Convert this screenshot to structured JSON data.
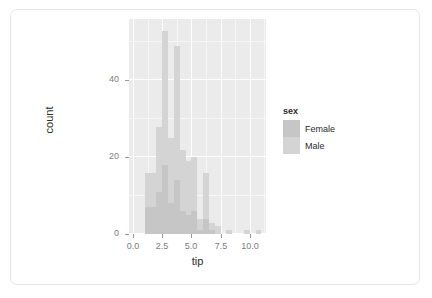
{
  "chart_data": {
    "type": "bar",
    "title": "",
    "subtitle": "",
    "xlabel": "tip",
    "ylabel": "count",
    "xlim": [
      -0.35,
      11.4
    ],
    "ylim": [
      0,
      56
    ],
    "xticks": [
      "0.0",
      "2.5",
      "5.0",
      "7.5",
      "10.0"
    ],
    "xtick_values": [
      0.0,
      2.5,
      5.0,
      7.5,
      10.0
    ],
    "yticks": [
      "0",
      "20",
      "40"
    ],
    "ytick_values": [
      0,
      20,
      40
    ],
    "grid": true,
    "legend_position": "right",
    "legend_title": "sex",
    "bin_width": 0.5,
    "stacked": true,
    "series": [
      {
        "name": "Female",
        "color": "#c6c6c6"
      },
      {
        "name": "Male",
        "color": "#d4d4d4"
      }
    ],
    "bins": [
      {
        "x0": 1.0,
        "x1": 1.5,
        "female": 7,
        "male": 9,
        "total": 16
      },
      {
        "x0": 1.5,
        "x1": 2.0,
        "female": 7,
        "male": 9,
        "total": 16
      },
      {
        "x0": 2.0,
        "x1": 2.5,
        "female": 11,
        "male": 17,
        "total": 28
      },
      {
        "x0": 2.5,
        "x1": 3.0,
        "female": 18,
        "male": 35,
        "total": 53
      },
      {
        "x0": 3.0,
        "x1": 3.5,
        "female": 8,
        "male": 17,
        "total": 25
      },
      {
        "x0": 3.5,
        "x1": 4.0,
        "female": 14,
        "male": 35,
        "total": 49
      },
      {
        "x0": 4.0,
        "x1": 4.5,
        "female": 6,
        "male": 16,
        "total": 22
      },
      {
        "x0": 4.5,
        "x1": 5.0,
        "female": 5,
        "male": 14,
        "total": 19
      },
      {
        "x0": 5.0,
        "x1": 5.5,
        "female": 6,
        "male": 14,
        "total": 20
      },
      {
        "x0": 5.5,
        "x1": 6.0,
        "female": 1,
        "male": 3,
        "total": 4
      },
      {
        "x0": 6.0,
        "x1": 6.5,
        "female": 4,
        "male": 12,
        "total": 16
      },
      {
        "x0": 6.5,
        "x1": 7.0,
        "female": 1,
        "male": 2,
        "total": 3
      },
      {
        "x0": 7.0,
        "x1": 7.5,
        "female": 0,
        "male": 2,
        "total": 2
      },
      {
        "x0": 8.0,
        "x1": 8.5,
        "female": 0,
        "male": 1,
        "total": 1
      },
      {
        "x0": 9.5,
        "x1": 10.0,
        "female": 0,
        "male": 1,
        "total": 1
      },
      {
        "x0": 10.5,
        "x1": 11.0,
        "female": 0,
        "male": 1,
        "total": 1
      }
    ]
  },
  "legend": {
    "title": "sex",
    "items": [
      {
        "label": "Female",
        "color": "#c6c6c6"
      },
      {
        "label": "Male",
        "color": "#d4d4d4"
      }
    ]
  },
  "colors": {
    "panel_background": "#ebebeb",
    "grid": "#ffffff",
    "card_background": "#ffffff",
    "card_border": "#e6e6e6",
    "axis_text": "#7d7d7d",
    "axis_title": "#2b2b2b",
    "tick_mark": "#9a9a9a"
  }
}
